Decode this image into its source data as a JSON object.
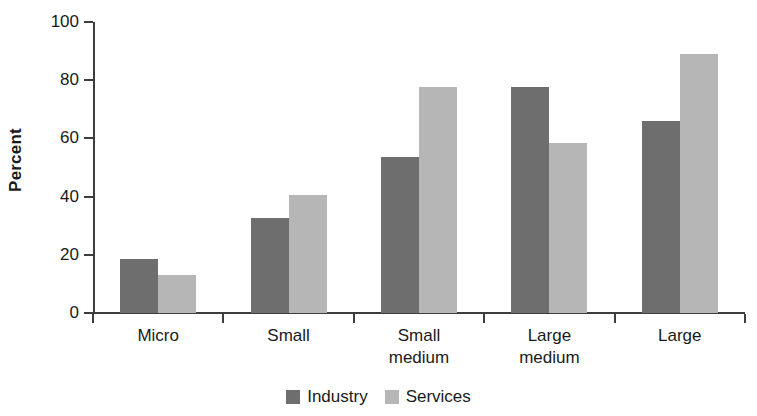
{
  "chart_data": {
    "type": "bar",
    "title": "",
    "subtitle": "",
    "xlabel": "",
    "ylabel": "Percent",
    "categories": [
      "Micro",
      "Small",
      "Small medium",
      "Large medium",
      "Large"
    ],
    "category_lines": [
      [
        "Micro",
        ""
      ],
      [
        "Small",
        ""
      ],
      [
        "Small",
        "medium"
      ],
      [
        "Large",
        "medium"
      ],
      [
        "Large",
        ""
      ]
    ],
    "series": [
      {
        "name": "Industry",
        "color": "#6e6e6e",
        "values": [
          18.5,
          32.5,
          53.5,
          77.5,
          66.0
        ]
      },
      {
        "name": "Services",
        "color": "#b6b6b6",
        "values": [
          13.0,
          40.5,
          77.5,
          58.5,
          89.0
        ]
      }
    ],
    "ylim": [
      0,
      100
    ],
    "yticks": [
      0,
      20,
      40,
      60,
      80,
      100
    ],
    "ytick_labels": [
      "0",
      "20",
      "40",
      "60",
      "80",
      "100"
    ],
    "grid": false,
    "legend_position": "bottom-center",
    "axis_color": "#3d3d3d",
    "text_color": "#1a1a1a",
    "background": "#ffffff"
  }
}
